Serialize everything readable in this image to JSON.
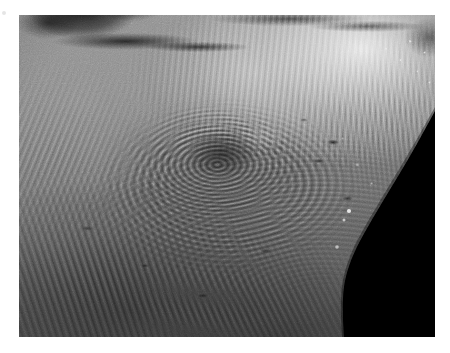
{
  "canvas": {
    "width": 450,
    "height": 353,
    "background_color": "#ffffff"
  },
  "image": {
    "kind": "natural-image",
    "subject": "planetary surface",
    "description": "Grayscale spacecraft image of a heavily grooved and ridged icy planetary surface, with the curved limb of the body silhouetted against black space at the lower right.",
    "color_mode": "grayscale",
    "frame": {
      "left": 19,
      "top": 15,
      "width": 416,
      "height": 322
    },
    "tonal_range": {
      "darkest_hex": "#000000",
      "shadow_hex": "#1b1b1b",
      "midtone_hex": "#7d7d7d",
      "highlight_hex": "#d9d9d9",
      "brightest_hex": "#f2f2f2"
    },
    "features": [
      {
        "name": "dark-trough-upper-left",
        "label": "Dark fracture / trough",
        "location": "upper left",
        "tone": "very dark"
      },
      {
        "name": "bright-grooved-plains-upper-right",
        "label": "Bright grooved plains",
        "location": "upper right",
        "tone": "high albedo"
      },
      {
        "name": "concentric-basin-centre",
        "label": "Concentric ridged basin",
        "location": "centre",
        "tone": "mid grey"
      },
      {
        "name": "streaked-terrain-lower-left",
        "label": "Streaked dark terrain",
        "location": "lower left",
        "tone": "dark grey"
      },
      {
        "name": "knobby-rough-terrain",
        "label": "Bright knobby rough terrain",
        "location": "upper right rim",
        "tone": "bright speckled"
      },
      {
        "name": "limb-shadow",
        "label": "Limb against space",
        "location": "lower right",
        "tone": "black"
      }
    ],
    "illumination": {
      "light_direction": "upper right",
      "terminator_present": false
    },
    "limb_outline_points": "434,120 428,133 414,158 400,186 386,212 372,236 358,258 348,280 344,300 342,322"
  },
  "artifacts": {
    "edge_speck": {
      "name": "edge-speck",
      "x": 2,
      "y": 11
    }
  }
}
